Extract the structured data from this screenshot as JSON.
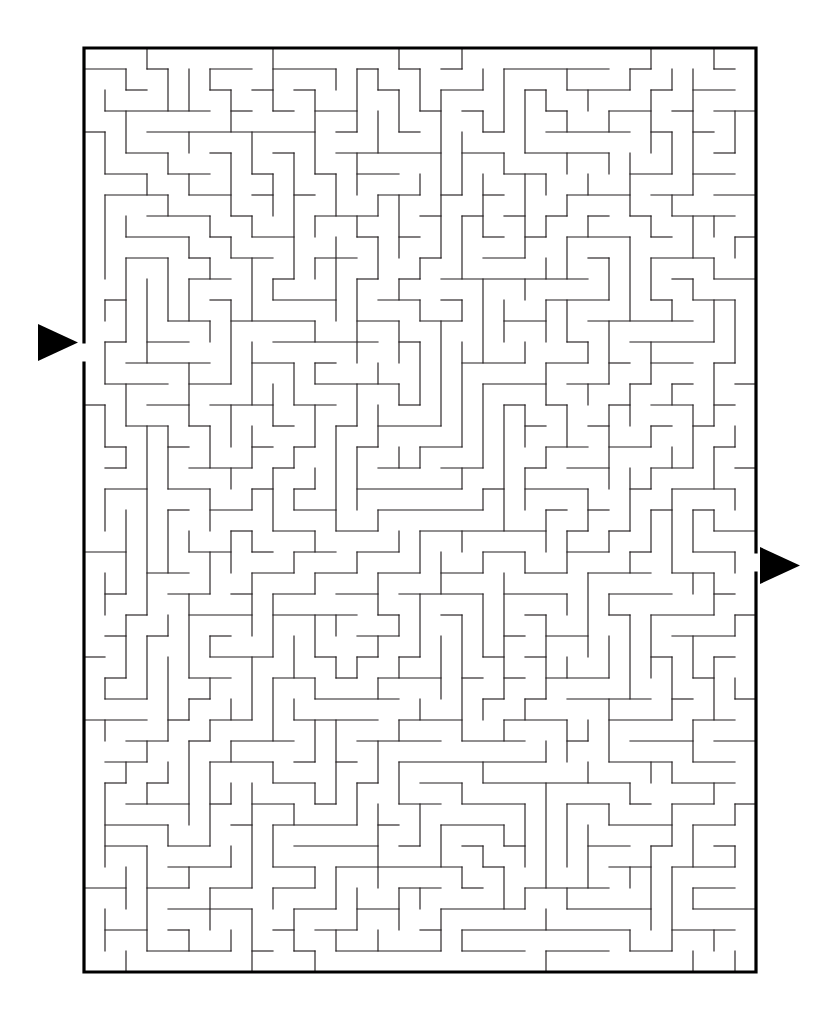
{
  "page": {
    "title": "Maze Puzzle",
    "background_color": "#ffffff",
    "width": 830,
    "height": 1021
  },
  "maze": {
    "name": "rectangular-perfect-maze",
    "columns": 32,
    "rows": 44,
    "cell_size": 21,
    "origin_x": 84,
    "origin_y": 48,
    "wall_color": "#231f20",
    "border_color": "#000000",
    "wall_thickness": 1.15,
    "border_thickness": 3.2,
    "seed": 20240517,
    "entrance": {
      "label": "Entrance",
      "side": "left",
      "row": 14,
      "column": 0
    },
    "exit": {
      "label": "Exit",
      "side": "right",
      "row": 24,
      "column": 31
    }
  },
  "markers": {
    "entrance_arrow": {
      "name": "entrance-arrow",
      "direction": "right",
      "x": 38,
      "y": 324,
      "width": 40,
      "height": 37,
      "color": "#000000"
    },
    "exit_arrow": {
      "name": "exit-arrow",
      "direction": "right",
      "x": 760,
      "y": 547,
      "width": 40,
      "height": 37,
      "color": "#000000"
    }
  }
}
